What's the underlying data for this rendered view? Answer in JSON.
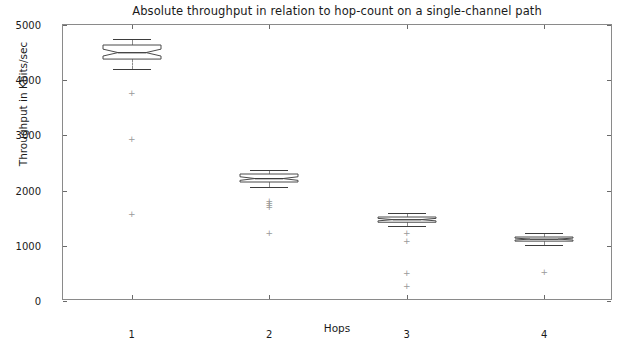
{
  "chart_data": {
    "type": "box",
    "title": "Absolute throughput in relation to hop-count on a single-channel path",
    "xlabel": "Hops",
    "ylabel": "Throughput in Kbits/sec",
    "categories": [
      "1",
      "2",
      "3",
      "4"
    ],
    "xtick_labels": [
      "1",
      "2",
      "3",
      "4"
    ],
    "ytick_labels": [
      "0",
      "1000",
      "2000",
      "3000",
      "4000",
      "5000"
    ],
    "ytick_values": [
      0,
      1000,
      2000,
      3000,
      4000,
      5000
    ],
    "ylim": [
      0,
      5000
    ],
    "xlim": [
      0.5,
      4.5
    ],
    "grid": false,
    "legend": null,
    "notched": true,
    "boxes": [
      {
        "category": "1",
        "whisker_low": 4200,
        "q1": 4385,
        "median": 4500,
        "q3": 4640,
        "whisker_high": 4745,
        "notch_low": 4440,
        "notch_high": 4565,
        "outliers": [
          3770,
          2935,
          1576
        ]
      },
      {
        "category": "2",
        "whisker_low": 2065,
        "q1": 2155,
        "median": 2215,
        "q3": 2300,
        "whisker_high": 2375,
        "notch_low": 2185,
        "notch_high": 2250,
        "outliers": [
          1810,
          1775,
          1735,
          1700,
          1235
        ]
      },
      {
        "category": "3",
        "whisker_low": 1350,
        "q1": 1425,
        "median": 1470,
        "q3": 1520,
        "whisker_high": 1600,
        "notch_low": 1450,
        "notch_high": 1495,
        "outliers": [
          1240,
          1095,
          510,
          280
        ]
      },
      {
        "category": "4",
        "whisker_low": 1020,
        "q1": 1080,
        "median": 1115,
        "q3": 1155,
        "whisker_high": 1225,
        "notch_low": 1100,
        "notch_high": 1135,
        "outliers": [
          525
        ]
      }
    ],
    "outlier_marker": "+"
  },
  "axes": {
    "frame_color": "#8a8a8a",
    "tick_color": "#6a6a6a",
    "text_color": "#1a1a1a"
  },
  "style": {
    "box_edge_color": "#4a4a4a",
    "median_color": "#2b2b2b",
    "whisker_color": "#8c8c8c",
    "cap_color": "#3d3d3d",
    "outlier_color": "#9a9a9a",
    "background": "#ffffff"
  }
}
